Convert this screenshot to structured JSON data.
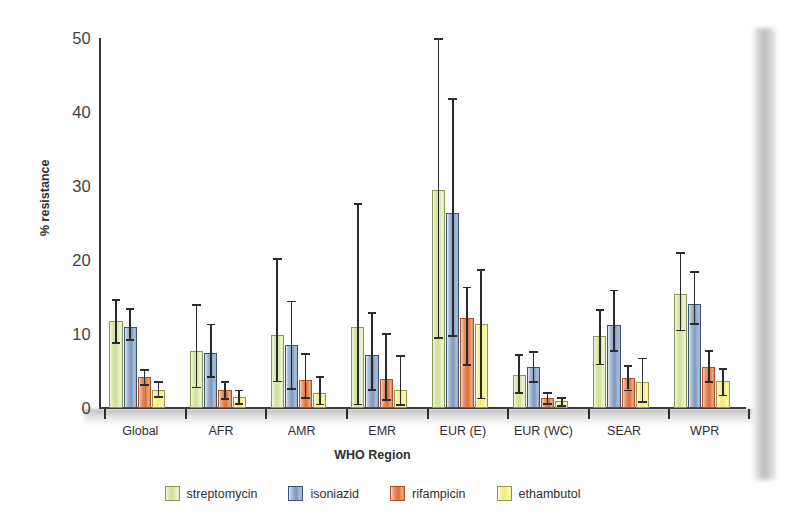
{
  "chart_data": {
    "type": "bar",
    "title": "",
    "xlabel": "WHO Region",
    "ylabel": "% resistance",
    "ylim": [
      0,
      50
    ],
    "yticks": [
      0,
      10,
      20,
      30,
      40,
      50
    ],
    "grid": false,
    "legend_position": "bottom-center",
    "error_bars": "95% confidence interval",
    "categories": [
      "Global",
      "AFR",
      "AMR",
      "EMR",
      "EUR (E)",
      "EUR (WC)",
      "SEAR",
      "WPR"
    ],
    "series": [
      {
        "name": "streptomycin",
        "color": "#cfe19a",
        "values": [
          11.7,
          7.7,
          9.8,
          10.9,
          29.5,
          4.5,
          9.7,
          15.4
        ],
        "err_low": [
          8.9,
          2.9,
          3.7,
          0.6,
          9.6,
          2.2,
          6.0,
          10.6
        ],
        "err_high": [
          14.7,
          14.0,
          20.3,
          27.7,
          50.0,
          7.3,
          13.4,
          21.1
        ]
      },
      {
        "name": "isoniazid",
        "color": "#8ea7c7",
        "values": [
          11.0,
          7.4,
          8.5,
          7.1,
          26.3,
          5.6,
          11.2,
          14.0
        ],
        "err_low": [
          9.3,
          4.3,
          2.7,
          2.6,
          9.9,
          3.6,
          7.8,
          11.5
        ],
        "err_high": [
          13.5,
          11.4,
          14.5,
          13.0,
          41.9,
          7.7,
          16.0,
          18.5
        ]
      },
      {
        "name": "rifampicin",
        "color": "#df7f4f",
        "values": [
          4.2,
          2.4,
          3.8,
          3.9,
          12.2,
          1.3,
          4.0,
          5.6
        ],
        "err_low": [
          3.2,
          1.3,
          1.5,
          1.2,
          5.9,
          0.7,
          2.5,
          3.6
        ],
        "err_high": [
          5.3,
          3.6,
          7.4,
          10.1,
          16.4,
          2.1,
          5.8,
          7.8
        ]
      },
      {
        "name": "ethambutol",
        "color": "#f2ed79",
        "values": [
          2.5,
          1.5,
          2.0,
          2.4,
          11.3,
          0.9,
          3.5,
          3.6
        ],
        "err_low": [
          1.6,
          0.7,
          0.6,
          0.5,
          1.4,
          0.4,
          0.9,
          1.8
        ],
        "err_high": [
          3.6,
          2.5,
          4.3,
          7.1,
          18.8,
          1.5,
          6.8,
          5.4
        ]
      }
    ]
  },
  "legend": {
    "items": [
      {
        "label": "streptomycin"
      },
      {
        "label": "isoniazid"
      },
      {
        "label": "rifampicin"
      },
      {
        "label": "ethambutol"
      }
    ]
  }
}
